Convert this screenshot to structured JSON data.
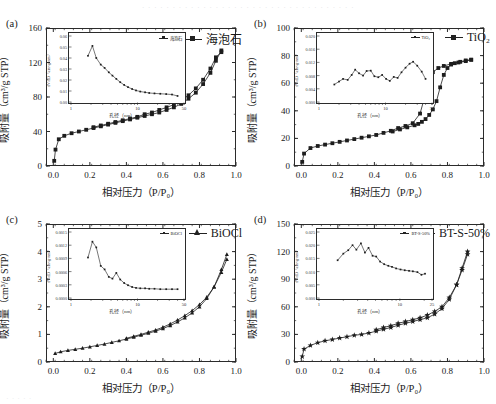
{
  "figure": {
    "top_bleed_text": "· · · · · · · · · · · · · · · · · · · · · · · · · · · · · · · · · · ·",
    "bottom_bleed_text": "· · · · ·",
    "axis": {
      "xlabel": "相对压力（P/P₀）",
      "ylabel": "吸附量（cm³/g STP）",
      "inset_xlabel": "孔径（nm）",
      "inset_ylabel": "dV/dD（cm³/g·nm）"
    }
  },
  "chart_data": [
    {
      "panel": "a",
      "tag": "(a)",
      "type": "line",
      "title": "",
      "legend": "海泡石",
      "marker": "square",
      "xlabel": "相对压力（P/P₀）",
      "ylabel": "吸附量（cm³/g STP）",
      "xlim": [
        -0.04,
        1.0
      ],
      "ylim": [
        0,
        160
      ],
      "xticks": [
        "0.0",
        "0.2",
        "0.4",
        "0.6",
        "0.8",
        "1.0"
      ],
      "xtickvals": [
        0.0,
        0.2,
        0.4,
        0.6,
        0.8,
        1.0
      ],
      "yticks": [
        "0",
        "40",
        "80",
        "120",
        "160"
      ],
      "ytickvals": [
        0,
        40,
        80,
        120,
        160
      ],
      "grid": false,
      "series": [
        {
          "name": "吸附支",
          "x": [
            0.005,
            0.012,
            0.03,
            0.06,
            0.1,
            0.14,
            0.18,
            0.22,
            0.26,
            0.3,
            0.34,
            0.38,
            0.42,
            0.46,
            0.5,
            0.54,
            0.58,
            0.62,
            0.66,
            0.7,
            0.74,
            0.78,
            0.82,
            0.86,
            0.89,
            0.92
          ],
          "y": [
            6,
            19,
            31,
            35,
            38,
            40,
            42,
            44,
            46,
            48,
            50,
            52,
            54,
            56,
            58,
            60,
            62,
            65,
            68,
            72,
            78,
            85,
            95,
            108,
            122,
            134
          ]
        },
        {
          "name": "脱附支",
          "x": [
            0.92,
            0.89,
            0.86,
            0.82,
            0.78,
            0.74,
            0.7,
            0.66,
            0.62,
            0.58,
            0.54,
            0.5,
            0.46,
            0.42,
            0.38,
            0.34,
            0.3,
            0.26,
            0.22
          ],
          "y": [
            132,
            126,
            113,
            100,
            90,
            82,
            76,
            71,
            68,
            65,
            62,
            60,
            57,
            55,
            53,
            51,
            49,
            47,
            45
          ]
        }
      ],
      "inset": {
        "legend": "海泡石",
        "xlabel": "孔径（nm）",
        "ylabel": "dV/dD（cm³/g·nm）",
        "xscale": "log",
        "xlim": [
          1,
          50
        ],
        "ylim": [
          0.0,
          0.06
        ],
        "xticks": [
          "1",
          "10",
          "50"
        ],
        "xtickvals": [
          1,
          10,
          50
        ],
        "yticks": [
          "0.00",
          "0.01",
          "0.02",
          "0.03",
          "0.04",
          "0.05",
          "0.06"
        ],
        "ytickvals": [
          0.0,
          0.01,
          0.02,
          0.03,
          0.04,
          0.05,
          0.06
        ],
        "x": [
          1.8,
          2.1,
          2.4,
          2.8,
          3.2,
          3.7,
          4.2,
          4.8,
          5.5,
          6.3,
          7.2,
          8.3,
          9.5,
          11,
          13,
          15,
          18,
          22,
          27,
          33,
          40
        ],
        "y": [
          0.042,
          0.051,
          0.04,
          0.034,
          0.031,
          0.027,
          0.024,
          0.021,
          0.018,
          0.0155,
          0.0135,
          0.0118,
          0.0105,
          0.0095,
          0.0088,
          0.0082,
          0.0078,
          0.0075,
          0.0072,
          0.0068,
          0.0055
        ]
      }
    },
    {
      "panel": "b",
      "tag": "(b)",
      "type": "line",
      "title": "",
      "legend": "TiO₂",
      "marker": "square",
      "xlabel": "相对压力（P/P₀）",
      "ylabel": "吸附量（cm³/g STP）",
      "xlim": [
        -0.04,
        1.0
      ],
      "ylim": [
        0,
        100
      ],
      "xticks": [
        "0.0",
        "0.2",
        "0.4",
        "0.6",
        "0.8",
        "1.0"
      ],
      "xtickvals": [
        0.0,
        0.2,
        0.4,
        0.6,
        0.8,
        1.0
      ],
      "yticks": [
        "0",
        "20",
        "40",
        "60",
        "80",
        "100"
      ],
      "ytickvals": [
        0,
        20,
        40,
        60,
        80,
        100
      ],
      "grid": false,
      "series": [
        {
          "name": "吸附支",
          "x": [
            0.005,
            0.015,
            0.05,
            0.09,
            0.13,
            0.17,
            0.21,
            0.25,
            0.29,
            0.33,
            0.37,
            0.41,
            0.45,
            0.49,
            0.53,
            0.57,
            0.61,
            0.65,
            0.69,
            0.72,
            0.75,
            0.78,
            0.82,
            0.86,
            0.9,
            0.93
          ],
          "y": [
            3,
            9,
            13,
            14.5,
            15.5,
            16.5,
            17.5,
            18.5,
            19.5,
            20.5,
            21.5,
            22.5,
            24,
            25.5,
            27.5,
            29,
            31,
            38,
            57,
            68,
            71,
            72.5,
            74,
            75,
            76,
            77
          ]
        },
        {
          "name": "脱附支",
          "x": [
            0.93,
            0.9,
            0.87,
            0.84,
            0.82,
            0.8,
            0.78,
            0.76,
            0.74,
            0.72,
            0.7,
            0.68,
            0.66,
            0.64,
            0.62,
            0.58,
            0.54,
            0.5
          ],
          "y": [
            77,
            76.5,
            75.5,
            74.5,
            73.5,
            71,
            66,
            57,
            47,
            41,
            37,
            34,
            32,
            30.5,
            29.5,
            28,
            26.5,
            25
          ]
        }
      ],
      "inset": {
        "legend": "TiO₂",
        "xlabel": "孔径（nm）",
        "ylabel": "dV/dD（cm³/g·nm）",
        "xscale": "log",
        "xlim": [
          1,
          50
        ],
        "ylim": [
          0.0,
          0.02
        ],
        "xticks": [
          "1",
          "10",
          "50"
        ],
        "xtickvals": [
          1,
          10,
          50
        ],
        "yticks": [
          "0.000",
          "0.004",
          "0.008",
          "0.012",
          "0.016",
          "0.020"
        ],
        "ytickvals": [
          0.0,
          0.004,
          0.008,
          0.012,
          0.016,
          0.02
        ],
        "x": [
          1.7,
          2.0,
          2.3,
          2.7,
          3.1,
          3.5,
          4.0,
          4.6,
          5.2,
          6.0,
          6.8,
          7.8,
          8.9,
          10.2,
          11.6,
          13.3,
          15.2,
          17.4,
          20,
          23,
          26,
          30,
          35,
          40
        ],
        "y": [
          0.0053,
          0.0062,
          0.007,
          0.0067,
          0.0082,
          0.0098,
          0.0087,
          0.008,
          0.0094,
          0.0095,
          0.0078,
          0.0075,
          0.0082,
          0.007,
          0.0064,
          0.0076,
          0.0073,
          0.009,
          0.0104,
          0.0116,
          0.0122,
          0.011,
          0.0092,
          0.007
        ]
      }
    },
    {
      "panel": "c",
      "tag": "(c)",
      "type": "line",
      "title": "",
      "legend": "BiOCl",
      "marker": "triangle",
      "xlabel": "相对压力（P/P₀）",
      "ylabel": "吸附量（cm³/g STP）",
      "xlim": [
        -0.04,
        1.0
      ],
      "ylim": [
        0,
        5
      ],
      "xticks": [
        "0.0",
        "0.2",
        "0.4",
        "0.6",
        "0.8",
        "1.0"
      ],
      "xtickvals": [
        0.0,
        0.2,
        0.4,
        0.6,
        0.8,
        1.0
      ],
      "yticks": [
        "0",
        "1",
        "2",
        "3",
        "4",
        "5"
      ],
      "ytickvals": [
        0,
        1,
        2,
        3,
        4,
        5
      ],
      "grid": false,
      "series": [
        {
          "name": "吸附支",
          "x": [
            0.01,
            0.04,
            0.08,
            0.12,
            0.16,
            0.2,
            0.24,
            0.28,
            0.32,
            0.36,
            0.4,
            0.44,
            0.48,
            0.52,
            0.56,
            0.6,
            0.64,
            0.68,
            0.72,
            0.76,
            0.8,
            0.84,
            0.88,
            0.92,
            0.95
          ],
          "y": [
            0.31,
            0.37,
            0.42,
            0.46,
            0.5,
            0.55,
            0.6,
            0.65,
            0.71,
            0.77,
            0.83,
            0.9,
            0.97,
            1.04,
            1.12,
            1.21,
            1.32,
            1.45,
            1.6,
            1.78,
            2.0,
            2.3,
            2.72,
            3.35,
            3.9
          ]
        },
        {
          "name": "脱附支",
          "x": [
            0.95,
            0.92,
            0.88,
            0.84,
            0.8,
            0.76,
            0.72,
            0.68,
            0.64,
            0.6,
            0.56,
            0.52,
            0.48,
            0.44,
            0.4
          ],
          "y": [
            3.72,
            3.25,
            2.72,
            2.35,
            2.08,
            1.86,
            1.68,
            1.52,
            1.38,
            1.26,
            1.16,
            1.08,
            1.0,
            0.93,
            0.86
          ]
        }
      ],
      "inset": {
        "legend": "BiOCl",
        "xlabel": "孔径（nm）",
        "ylabel": "dV/dD（cm³/g·nm）",
        "xscale": "log",
        "xlim": [
          1,
          50
        ],
        "ylim": [
          0.0,
          0.0015
        ],
        "xticks": [
          "1",
          "10",
          "50"
        ],
        "xtickvals": [
          1,
          10,
          50
        ],
        "yticks": [
          "0.0000",
          "0.0003",
          "0.0006",
          "0.0009",
          "0.0012",
          "0.0015"
        ],
        "ytickvals": [
          0.0,
          0.0003,
          0.0006,
          0.0009,
          0.0012,
          0.0015
        ],
        "x": [
          1.8,
          2.1,
          2.4,
          2.8,
          3.2,
          3.7,
          4.2,
          4.8,
          5.5,
          6.3,
          7.2,
          8.3,
          9.5,
          11,
          13,
          15,
          18,
          22,
          27,
          33,
          40
        ],
        "y": [
          0.00092,
          0.00128,
          0.00115,
          0.00073,
          0.00065,
          0.00048,
          0.00044,
          0.00057,
          0.00042,
          0.00034,
          0.00029,
          0.00025,
          0.00023,
          0.00022,
          0.00022,
          0.00021,
          0.00021,
          0.0002,
          0.0002,
          0.0002,
          0.0002
        ]
      }
    },
    {
      "panel": "d",
      "tag": "(d)",
      "type": "line",
      "title": "",
      "legend": "BT-S-50%",
      "marker": "star",
      "xlabel": "相对压力（P/P₀）",
      "ylabel": "吸附量（cm³/g STP）",
      "xlim": [
        -0.04,
        1.0
      ],
      "ylim": [
        0,
        150
      ],
      "xticks": [
        "0.0",
        "0.2",
        "0.4",
        "0.6",
        "0.8",
        "1.0"
      ],
      "xtickvals": [
        0.0,
        0.2,
        0.4,
        0.6,
        0.8,
        1.0
      ],
      "yticks": [
        "0",
        "30",
        "60",
        "90",
        "120",
        "150"
      ],
      "ytickvals": [
        0,
        30,
        60,
        90,
        120,
        150
      ],
      "grid": false,
      "series": [
        {
          "name": "吸附支",
          "x": [
            0.005,
            0.015,
            0.05,
            0.09,
            0.13,
            0.17,
            0.21,
            0.25,
            0.29,
            0.33,
            0.37,
            0.41,
            0.45,
            0.49,
            0.53,
            0.57,
            0.61,
            0.65,
            0.69,
            0.73,
            0.77,
            0.81,
            0.85,
            0.88,
            0.91
          ],
          "y": [
            6,
            14,
            18,
            21,
            23,
            24.5,
            26,
            27.5,
            29,
            30,
            31.5,
            33.5,
            35.5,
            37.5,
            40,
            42,
            44,
            46,
            48,
            52,
            58,
            68,
            84,
            102,
            120
          ]
        },
        {
          "name": "脱附支",
          "x": [
            0.91,
            0.88,
            0.85,
            0.81,
            0.77,
            0.73,
            0.69,
            0.65,
            0.61,
            0.57,
            0.53,
            0.49,
            0.45,
            0.41
          ],
          "y": [
            117,
            100,
            84,
            70,
            60,
            55,
            51,
            48,
            46,
            44,
            42,
            39.5,
            37.5,
            35
          ]
        }
      ],
      "inset": {
        "legend": "BT-S-50%",
        "xlabel": "孔径（nm）",
        "ylabel": "dV/dD（cm³/g·nm）",
        "xscale": "log",
        "xlim": [
          1,
          25
        ],
        "ylim": [
          0.0,
          0.025
        ],
        "xticks": [
          "1",
          "10",
          "25"
        ],
        "xtickvals": [
          1,
          10,
          25
        ],
        "yticks": [
          "0.000",
          "0.005",
          "0.010",
          "0.015",
          "0.020",
          "0.025"
        ],
        "ytickvals": [
          0.0,
          0.005,
          0.01,
          0.015,
          0.02,
          0.025
        ],
        "x": [
          1.7,
          2.0,
          2.3,
          2.6,
          2.9,
          3.3,
          3.7,
          4.1,
          4.6,
          5.1,
          5.7,
          6.4,
          7.2,
          8.0,
          9.0,
          10.2,
          11.5,
          13,
          14.5,
          16.5,
          18.5,
          20.5
        ],
        "y": [
          0.0143,
          0.0168,
          0.0181,
          0.02,
          0.0183,
          0.0207,
          0.0172,
          0.019,
          0.016,
          0.0157,
          0.0138,
          0.0128,
          0.0122,
          0.0118,
          0.0112,
          0.0108,
          0.0105,
          0.0103,
          0.0101,
          0.0098,
          0.0088,
          0.0092
        ]
      }
    }
  ]
}
